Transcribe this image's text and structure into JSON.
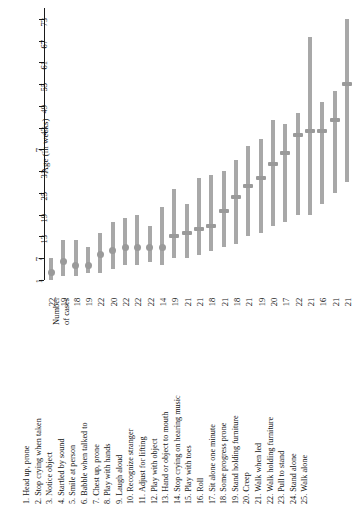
{
  "figure": {
    "axis_title": "Age (in weeks)",
    "cases_header_line1": "Number",
    "cases_header_line2": "of cases"
  },
  "chart_data": {
    "type": "bar",
    "title": "",
    "xlabel": "",
    "ylabel": "Age (in weeks)",
    "ylim": [
      1,
      76
    ],
    "grid": false,
    "legend": "none",
    "tick_labels": [
      "1",
      "7",
      "13",
      "19",
      "25",
      "31",
      "7",
      "43",
      "49",
      "55",
      "61",
      "67",
      "73"
    ],
    "tick_values": [
      1,
      7,
      13,
      19,
      25,
      31,
      37,
      43,
      49,
      55,
      61,
      67,
      73
    ],
    "orientation": "vertical-ranges",
    "categories": [
      "Head up, prone",
      "Stop crying when taken",
      "Notice object",
      "Startled by sound",
      "Smile at person",
      "Babble when talked to",
      "Chest up, prone",
      "Play with hands",
      "Laugh aloud",
      "Recognize stranger",
      "Adjust for lifting",
      "Play with object",
      "Hand or object to mouth",
      "Stop crying on hearing music",
      "Play with toes",
      "Roll",
      "Sit alone one minute",
      "Some progress prone",
      "Stand holding furniture",
      "Creep",
      "Walk when led",
      "Walk holding furniture",
      "Pull to stand",
      "Stand alone",
      "Walk alone"
    ],
    "number_of_cases": [
      22,
      19,
      18,
      19,
      22,
      20,
      22,
      22,
      22,
      14,
      19,
      21,
      21,
      18,
      21,
      18,
      21,
      19,
      20,
      17,
      22,
      21,
      16,
      21,
      21
    ],
    "series": [
      {
        "name": "low",
        "values": [
          1,
          2,
          2,
          3,
          3,
          4,
          5,
          5,
          6,
          5,
          7,
          7,
          8,
          9,
          10,
          11,
          13,
          14,
          16,
          17,
          19,
          19,
          22,
          25,
          28
        ]
      },
      {
        "name": "median",
        "values": [
          3,
          6,
          5,
          5,
          8,
          9,
          10,
          10,
          10,
          10,
          13,
          14,
          15,
          16,
          20,
          24,
          27,
          29,
          33,
          36,
          41,
          42,
          42,
          45,
          55
        ]
      },
      {
        "name": "high",
        "values": [
          7,
          12,
          12,
          10,
          14,
          17,
          18,
          19,
          16,
          21,
          26,
          22,
          29,
          30,
          31,
          34,
          38,
          40,
          45,
          44,
          47,
          68,
          50,
          53,
          73
        ]
      }
    ]
  },
  "items": [
    {
      "n": "1.",
      "label": "Head up, prone"
    },
    {
      "n": "2.",
      "label": "Stop crying when taken"
    },
    {
      "n": "3.",
      "label": "Notice object"
    },
    {
      "n": "4.",
      "label": "Startled by sound"
    },
    {
      "n": "5.",
      "label": "Smile at person"
    },
    {
      "n": "6.",
      "label": "Babble when talked to"
    },
    {
      "n": "7.",
      "label": "Chest up, prone"
    },
    {
      "n": "8.",
      "label": "Play with hands"
    },
    {
      "n": "9.",
      "label": "Laugh aloud"
    },
    {
      "n": "10.",
      "label": "Recognize stranger"
    },
    {
      "n": "11.",
      "label": "Adjust for lifting"
    },
    {
      "n": "12.",
      "label": "Play with object"
    },
    {
      "n": "13.",
      "label": "Hand or object to mouth"
    },
    {
      "n": "14.",
      "label": "Stop crying on hearing music"
    },
    {
      "n": "15.",
      "label": "Play with toes"
    },
    {
      "n": "16.",
      "label": "Roll"
    },
    {
      "n": "17.",
      "label": "Sit alone one minute"
    },
    {
      "n": "18.",
      "label": "Some progress prone"
    },
    {
      "n": "19.",
      "label": "Stand holding furniture"
    },
    {
      "n": "20.",
      "label": "Creep"
    },
    {
      "n": "21.",
      "label": "Walk when led"
    },
    {
      "n": "22.",
      "label": "Walk holding furniture"
    },
    {
      "n": "23.",
      "label": "Pull to stand"
    },
    {
      "n": "24.",
      "label": "Stand alone"
    },
    {
      "n": "25.",
      "label": "Walk alone"
    }
  ]
}
